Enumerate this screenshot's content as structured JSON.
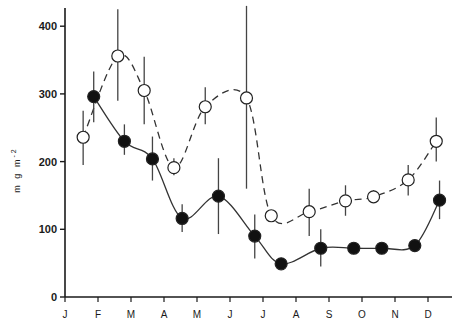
{
  "chart_data": {
    "type": "line",
    "title": "",
    "xlabel": "",
    "ylabel": "mg m-2",
    "ylim": [
      0,
      430
    ],
    "yticks": [
      0,
      100,
      200,
      300,
      400
    ],
    "xticks": [
      "J",
      "F",
      "M",
      "A",
      "M",
      "J",
      "J",
      "A",
      "S",
      "O",
      "N",
      "D"
    ],
    "grid": false,
    "legend": null,
    "series": [
      {
        "name": "open circles (dashed)",
        "marker": "open-circle",
        "linestyle": "dashed",
        "points": [
          {
            "x": 0.55,
            "y": 236,
            "err_low": 195,
            "err_high": 275
          },
          {
            "x": 1.6,
            "y": 356,
            "err_low": 290,
            "err_high": 425
          },
          {
            "x": 2.4,
            "y": 305,
            "err_low": 255,
            "err_high": 355
          },
          {
            "x": 3.3,
            "y": 191,
            "err_low": 180,
            "err_high": 205
          },
          {
            "x": 4.25,
            "y": 281,
            "err_low": 255,
            "err_high": 310
          },
          {
            "x": 5.5,
            "y": 294,
            "err_low": 160,
            "err_high": 430
          },
          {
            "x": 6.25,
            "y": 120,
            "err_low": 115,
            "err_high": 125
          },
          {
            "x": 7.4,
            "y": 126,
            "err_low": 90,
            "err_high": 160
          },
          {
            "x": 8.5,
            "y": 142,
            "err_low": 120,
            "err_high": 165
          },
          {
            "x": 9.35,
            "y": 148,
            "err_low": 140,
            "err_high": 158
          },
          {
            "x": 10.4,
            "y": 173,
            "err_low": 150,
            "err_high": 195
          },
          {
            "x": 11.25,
            "y": 230,
            "err_low": 200,
            "err_high": 265
          }
        ]
      },
      {
        "name": "filled circles (solid)",
        "marker": "filled-circle",
        "linestyle": "solid",
        "points": [
          {
            "x": 0.87,
            "y": 296,
            "err_low": 258,
            "err_high": 333
          },
          {
            "x": 1.8,
            "y": 230,
            "err_low": 210,
            "err_high": 255
          },
          {
            "x": 2.65,
            "y": 204,
            "err_low": 172,
            "err_high": 237
          },
          {
            "x": 3.55,
            "y": 116,
            "err_low": 96,
            "err_high": 137
          },
          {
            "x": 4.65,
            "y": 149,
            "err_low": 93,
            "err_high": 205
          },
          {
            "x": 5.75,
            "y": 90,
            "err_low": 57,
            "err_high": 122
          },
          {
            "x": 6.55,
            "y": 49,
            "err_low": 49,
            "err_high": 49
          },
          {
            "x": 7.75,
            "y": 72,
            "err_low": 45,
            "err_high": 100
          },
          {
            "x": 8.75,
            "y": 72,
            "err_low": 72,
            "err_high": 72
          },
          {
            "x": 9.6,
            "y": 72,
            "err_low": 72,
            "err_high": 72
          },
          {
            "x": 10.6,
            "y": 76,
            "err_low": 76,
            "err_high": 76
          },
          {
            "x": 11.35,
            "y": 143,
            "err_low": 115,
            "err_high": 172
          }
        ]
      }
    ]
  },
  "axis": {
    "ylabel_text": "m g   m",
    "ylabel_sup": "-2",
    "ytick_labels": [
      "0",
      "100",
      "200",
      "300",
      "400"
    ],
    "month_labels": [
      "J",
      "F",
      "M",
      "A",
      "M",
      "J",
      "J",
      "A",
      "S",
      "O",
      "N",
      "D"
    ]
  }
}
